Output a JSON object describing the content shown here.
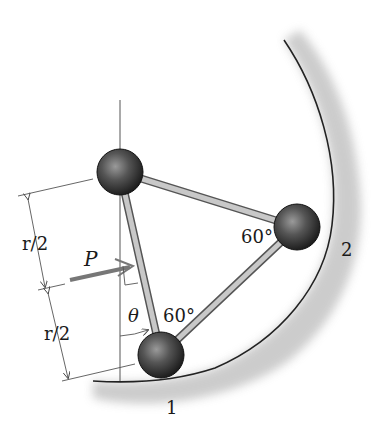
{
  "diagram": {
    "type": "mechanics-figure",
    "labels": {
      "force": "P",
      "angle_theta": "θ",
      "angle_top_right": "60°",
      "angle_bottom": "60°",
      "dim_upper": "r/2",
      "dim_lower": "r/2",
      "contact_1": "1",
      "contact_2": "2"
    },
    "nodes": [
      {
        "id": "top-ball",
        "cx": 120,
        "cy": 172,
        "r": 23
      },
      {
        "id": "right-ball",
        "cx": 297,
        "cy": 227,
        "r": 23
      },
      {
        "id": "bottom-ball",
        "cx": 161,
        "cy": 355,
        "r": 23
      }
    ],
    "colors": {
      "ball": "#3a3a3a",
      "rod": "#a8a8a8",
      "surface_shade": "#bdbdbd",
      "line": "#555555"
    }
  }
}
